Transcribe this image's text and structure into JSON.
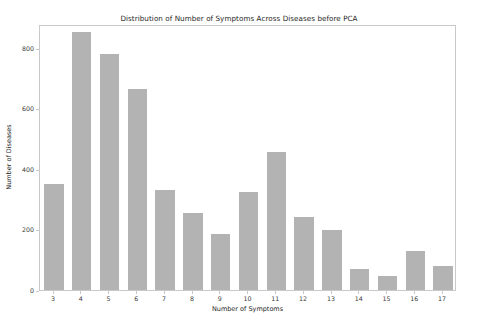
{
  "chart_data": {
    "type": "bar",
    "title": "Distribution of Number of Symptoms Across Diseases before PCA",
    "xlabel": "Number of Symptoms",
    "ylabel": "Number of Diseases",
    "categories": [
      "3",
      "4",
      "5",
      "6",
      "7",
      "8",
      "9",
      "10",
      "11",
      "12",
      "13",
      "14",
      "15",
      "16",
      "17"
    ],
    "values": [
      350,
      855,
      780,
      665,
      330,
      255,
      185,
      325,
      455,
      240,
      200,
      70,
      45,
      130,
      80
    ],
    "ylim": [
      0,
      880
    ],
    "yticks": [
      0,
      200,
      400,
      600,
      800
    ],
    "ytick_labels": [
      "0",
      "200",
      "400",
      "600",
      "800"
    ],
    "grid": false,
    "legend": null,
    "bar_color": "#b3b3b3",
    "axis_color": "#c9c9c9",
    "text_color": "#262626",
    "background": "#ffffff"
  }
}
